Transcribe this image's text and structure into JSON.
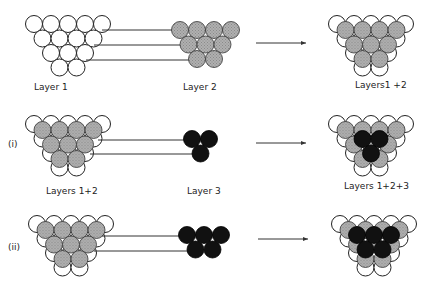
{
  "diagram": {
    "rows": [
      {
        "marker": "",
        "left_label": "Layer 1",
        "middle_label": "Layer 2",
        "right_label": "Layers1 +2"
      },
      {
        "marker": "(i)",
        "left_label": "Layers 1+2",
        "middle_label": "Layer 3",
        "right_label": "Layers 1+2+3"
      },
      {
        "marker": "(ii)",
        "left_label": "",
        "middle_label": "",
        "right_label": ""
      }
    ],
    "colors": {
      "layer1": "#ffffff",
      "layer2": "#a8a8a8",
      "layer3": "#111111",
      "outline": "#222222"
    }
  }
}
